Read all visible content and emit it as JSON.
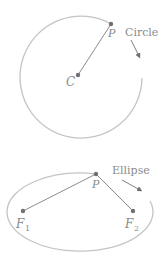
{
  "circle": {
    "title": "Circle",
    "center_label": "C",
    "point_label": "P"
  },
  "ellipse": {
    "title": "Ellipse",
    "point_label": "P",
    "focus1_label": "F",
    "focus1_sub": "1",
    "focus2_label": "F",
    "focus2_sub": "2"
  },
  "colors": {
    "curve": "#c4c4c4",
    "point": "#707070",
    "segment": "#8c8c8c",
    "text": "#8a8a8a"
  }
}
